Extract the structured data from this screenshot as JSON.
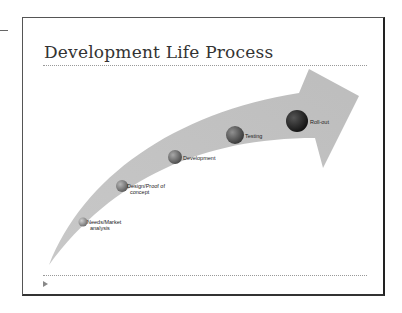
{
  "slide": {
    "title": "Development Life Process",
    "steps": [
      {
        "label_line1": "Needs/Market",
        "label_line2": "analysis",
        "color": "#9a9a9a"
      },
      {
        "label_line1": "Design/Proof of",
        "label_line2": "concept",
        "color": "#8a8a8a"
      },
      {
        "label_line1": "Development",
        "label_line2": "",
        "color": "#7a7a7a"
      },
      {
        "label_line1": "Testing",
        "label_line2": "",
        "color": "#5e5e5e"
      },
      {
        "label_line1": "Roll-out",
        "label_line2": "",
        "color": "#2a2a2a"
      }
    ]
  }
}
